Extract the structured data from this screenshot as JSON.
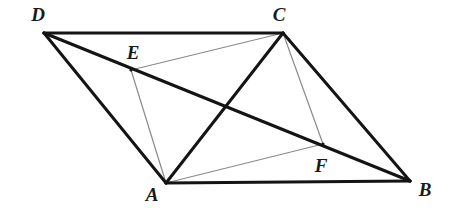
{
  "figure": {
    "kind": "geometry-diagram",
    "width": 451,
    "height": 208,
    "background_color": "#ffffff",
    "stroke_dark_color": "#141414",
    "stroke_light_color": "#8a8a8a",
    "stroke_dark_width": 3.0,
    "stroke_light_width": 1.2
  },
  "points": [
    {
      "id": "D",
      "label": "D",
      "x": 44,
      "y": 33,
      "label_x": 38,
      "label_y": 14
    },
    {
      "id": "C",
      "label": "C",
      "x": 283,
      "y": 33,
      "label_x": 279,
      "label_y": 14
    },
    {
      "id": "E",
      "label": "E",
      "x": 131,
      "y": 70,
      "label_x": 133,
      "label_y": 52
    },
    {
      "id": "F",
      "label": "F",
      "x": 323,
      "y": 144,
      "label_x": 321,
      "label_y": 165
    },
    {
      "id": "A",
      "label": "A",
      "x": 166,
      "y": 183,
      "label_x": 152,
      "label_y": 194
    },
    {
      "id": "B",
      "label": "B",
      "x": 410,
      "y": 181,
      "label_x": 425,
      "label_y": 189
    }
  ],
  "segments": [
    {
      "id": "DC",
      "from": "D",
      "to": "C",
      "weight": "heavy"
    },
    {
      "id": "AB",
      "from": "A",
      "to": "B",
      "weight": "heavy"
    },
    {
      "id": "DA",
      "from": "D",
      "to": "A",
      "weight": "heavy"
    },
    {
      "id": "CB",
      "from": "C",
      "to": "B",
      "weight": "heavy"
    },
    {
      "id": "DB",
      "from": "D",
      "to": "B",
      "weight": "heavy"
    },
    {
      "id": "AC",
      "from": "A",
      "to": "C",
      "weight": "heavy"
    },
    {
      "id": "CE",
      "from": "C",
      "to": "E",
      "weight": "light"
    },
    {
      "id": "EA",
      "from": "E",
      "to": "A",
      "weight": "light"
    },
    {
      "id": "AF",
      "from": "A",
      "to": "F",
      "weight": "light"
    },
    {
      "id": "FC",
      "from": "F",
      "to": "C",
      "weight": "light"
    }
  ]
}
